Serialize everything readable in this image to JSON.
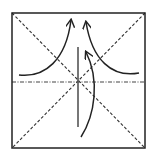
{
  "diagram": {
    "type": "origami-fold-diagram",
    "colors": {
      "background": "#ffffff",
      "ink": "#222222",
      "valley_fold": "#333333",
      "mountain_fold": "#444444"
    },
    "paper_square": {
      "x": 12,
      "y": 13,
      "width": 133,
      "height": 135
    },
    "crease_lines": [
      {
        "kind": "valley-fold",
        "style": "dashed",
        "label": "diagonal-tl-br",
        "x1": 12,
        "y1": 13,
        "x2": 145,
        "y2": 148
      },
      {
        "kind": "valley-fold",
        "style": "dashed",
        "label": "diagonal-tr-bl",
        "x1": 145,
        "y1": 13,
        "x2": 12,
        "y2": 148
      },
      {
        "kind": "mountain-fold",
        "style": "dash-dot",
        "label": "horizontal-center",
        "x1": 12,
        "y1": 82,
        "x2": 145,
        "y2": 82
      }
    ],
    "cut_line": {
      "label": "vertical-center-line",
      "x1": 78,
      "y1": 47,
      "x2": 78,
      "y2": 127
    },
    "arrows": [
      {
        "label": "left-flap-up",
        "path": "M 19 75 C 45 78, 66 60, 71 20"
      },
      {
        "label": "right-flap-up",
        "path": "M 139 73 C 112 78, 92 60, 86 22"
      },
      {
        "label": "bottom-flap-up",
        "path": "M 81 137 C 95 115, 100 80, 86 52"
      }
    ]
  }
}
